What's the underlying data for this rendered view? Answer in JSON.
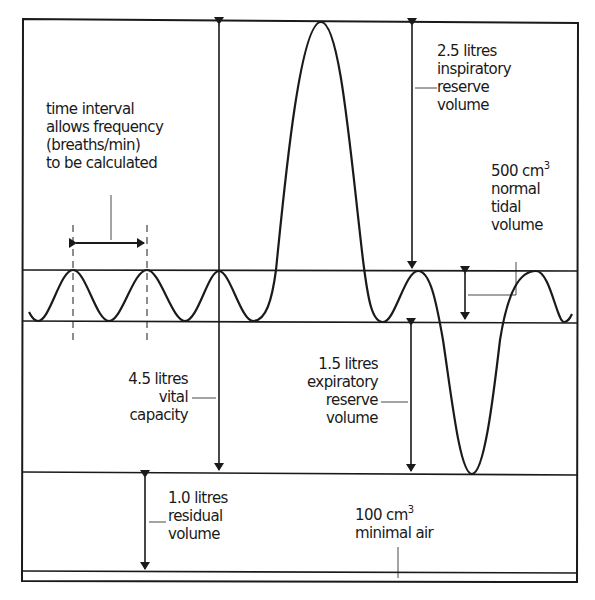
{
  "diagram": {
    "stroke_color": "#1a1a1a",
    "labels": {
      "time_interval": [
        "time interval",
        "allows frequency",
        "(breaths/min)",
        "to be calculated"
      ],
      "inspiratory": [
        "2.5 litres",
        "inspiratory",
        "reserve",
        "volume"
      ],
      "tidal": {
        "value": "500 cm",
        "unit_sup": "3",
        "lines": [
          "normal",
          "tidal",
          "volume"
        ]
      },
      "vital": [
        "4.5 litres",
        "vital",
        "capacity"
      ],
      "expiratory": [
        "1.5 litres",
        "expiratory",
        "reserve",
        "volume"
      ],
      "residual": [
        "1.0 litres",
        "residual",
        "volume"
      ],
      "minimal": {
        "value": "100 cm",
        "unit_sup": "3",
        "line": "minimal air"
      }
    },
    "volumes": [
      {
        "name": "inspiratory reserve volume",
        "amount": "2.5 litres"
      },
      {
        "name": "normal tidal volume",
        "amount": "500 cm3"
      },
      {
        "name": "vital capacity",
        "amount": "4.5 litres"
      },
      {
        "name": "expiratory reserve volume",
        "amount": "1.5 litres"
      },
      {
        "name": "residual volume",
        "amount": "1.0 litres"
      },
      {
        "name": "minimal air",
        "amount": "100 cm3"
      }
    ]
  }
}
